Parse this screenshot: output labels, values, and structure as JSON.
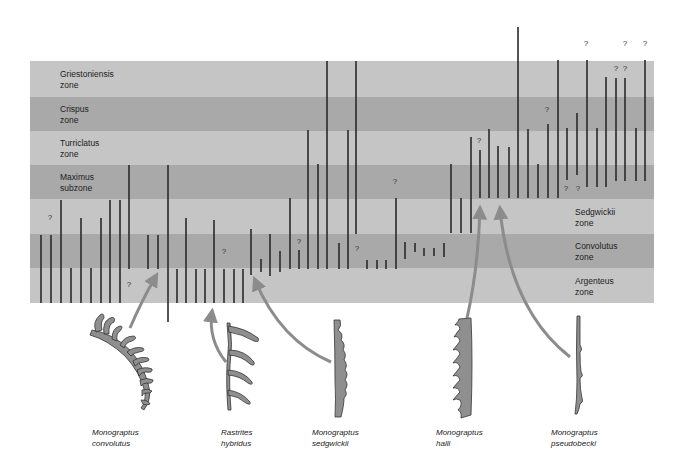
{
  "figure": {
    "zones": [
      {
        "name": "Griestoniensis",
        "rank": "zone",
        "top": 61,
        "bottom": 97,
        "shade": "light"
      },
      {
        "name": "Crispus",
        "rank": "zone",
        "top": 97,
        "bottom": 131,
        "shade": "dark"
      },
      {
        "name": "Turriclatus",
        "rank": "zone",
        "top": 131,
        "bottom": 165,
        "shade": "light"
      },
      {
        "name": "Maximus",
        "rank": "subzone",
        "top": 165,
        "bottom": 199,
        "shade": "dark"
      },
      {
        "name": "Sedgwickii",
        "rank": "zone",
        "top": 199,
        "bottom": 234,
        "shade": "light"
      },
      {
        "name": "Convolutus",
        "rank": "zone",
        "top": 234,
        "bottom": 268,
        "shade": "dark"
      },
      {
        "name": "Argenteus",
        "rank": "zone",
        "top": 268,
        "bottom": 303,
        "shade": "light"
      }
    ],
    "colors": {
      "light_band": "#c5c5c5",
      "dark_band": "#a9a9a9",
      "range_line": "#2a2a2a",
      "arrow": "#8c8c8c",
      "specimen_fill": "#8f8f8f",
      "specimen_stroke": "#333333"
    },
    "species": [
      {
        "genus": "Monograptus",
        "epithet": "convolutus"
      },
      {
        "genus": "Rastrites",
        "epithet": "hybridus"
      },
      {
        "genus": "Monograptus",
        "epithet": "sedgwickii"
      },
      {
        "genus": "Monograptus",
        "epithet": "halli"
      },
      {
        "genus": "Monograptus",
        "epithet": "pseudobecki"
      }
    ],
    "uncertain_marker": "?"
  },
  "chart_data": {
    "type": "range-chart",
    "title": "",
    "y_categories_top_to_bottom": [
      "Griestoniensis zone",
      "Crispus zone",
      "Turriclatus zone",
      "Maximus subzone",
      "Sedgwickii zone",
      "Convolutus zone",
      "Argenteus zone"
    ],
    "ranges_px": [
      [
        41,
        235,
        303
      ],
      [
        51,
        235,
        303
      ],
      [
        61,
        200,
        303
      ],
      [
        71,
        268,
        303
      ],
      [
        81,
        218,
        303
      ],
      [
        91,
        268,
        303
      ],
      [
        101,
        218,
        303
      ],
      [
        110,
        200,
        303
      ],
      [
        120,
        200,
        303
      ],
      [
        129,
        165,
        269
      ],
      [
        148,
        235,
        269
      ],
      [
        158,
        235,
        269
      ],
      [
        168,
        165,
        322
      ],
      [
        177,
        269,
        303
      ],
      [
        186,
        218,
        303
      ],
      [
        196,
        269,
        303
      ],
      [
        205,
        269,
        303
      ],
      [
        214,
        220,
        303
      ],
      [
        224,
        269,
        303
      ],
      [
        234,
        269,
        303
      ],
      [
        243,
        269,
        303
      ],
      [
        251,
        229,
        275
      ],
      [
        261,
        259,
        272
      ],
      [
        270,
        234,
        276
      ],
      [
        280,
        251,
        272
      ],
      [
        290,
        198,
        269
      ],
      [
        299,
        250,
        269
      ],
      [
        308,
        130,
        269
      ],
      [
        318,
        164,
        269
      ],
      [
        327,
        61,
        269
      ],
      [
        339,
        243,
        269
      ],
      [
        348,
        130,
        269
      ],
      [
        356,
        61,
        234
      ],
      [
        367,
        260,
        269
      ],
      [
        377,
        260,
        269
      ],
      [
        386,
        260,
        269
      ],
      [
        396,
        198,
        269
      ],
      [
        405,
        242,
        259
      ],
      [
        415,
        243,
        252
      ],
      [
        424,
        248,
        256
      ],
      [
        434,
        248,
        256
      ],
      [
        444,
        243,
        257
      ],
      [
        451,
        164,
        233
      ],
      [
        461,
        198,
        233
      ],
      [
        471,
        137,
        233
      ],
      [
        480,
        150,
        198
      ],
      [
        489,
        129,
        198
      ],
      [
        498,
        146,
        198
      ],
      [
        509,
        147,
        198
      ],
      [
        518,
        27,
        198
      ],
      [
        528,
        129,
        198
      ],
      [
        538,
        164,
        198
      ],
      [
        548,
        124,
        198
      ],
      [
        558,
        60,
        198
      ],
      [
        567,
        128,
        180
      ],
      [
        577,
        113,
        175
      ],
      [
        587,
        60,
        187
      ],
      [
        597,
        128,
        187
      ],
      [
        606,
        77,
        187
      ],
      [
        616,
        78,
        181
      ],
      [
        625,
        78,
        181
      ],
      [
        636,
        128,
        181
      ],
      [
        645,
        60,
        181
      ]
    ],
    "uncertain_markers_px": [
      [
        50,
        217
      ],
      [
        129,
        284
      ],
      [
        224,
        251
      ],
      [
        299,
        241
      ],
      [
        357,
        248
      ],
      [
        395,
        181
      ],
      [
        479,
        140
      ],
      [
        547,
        109
      ],
      [
        566,
        188
      ],
      [
        578,
        188
      ],
      [
        586,
        43
      ],
      [
        616,
        68
      ],
      [
        625,
        68
      ],
      [
        625,
        43
      ],
      [
        645,
        43
      ]
    ],
    "arrows": [
      {
        "species": "Monograptus convolutus",
        "points_to_x": 158
      },
      {
        "species": "Rastrites hybridus",
        "points_to_x": 213
      },
      {
        "species": "Monograptus sedgwickii",
        "points_to_x": 253
      },
      {
        "species": "Monograptus halli",
        "points_to_x": 480
      },
      {
        "species": "Monograptus pseudobecki",
        "points_to_x": 499
      }
    ]
  }
}
